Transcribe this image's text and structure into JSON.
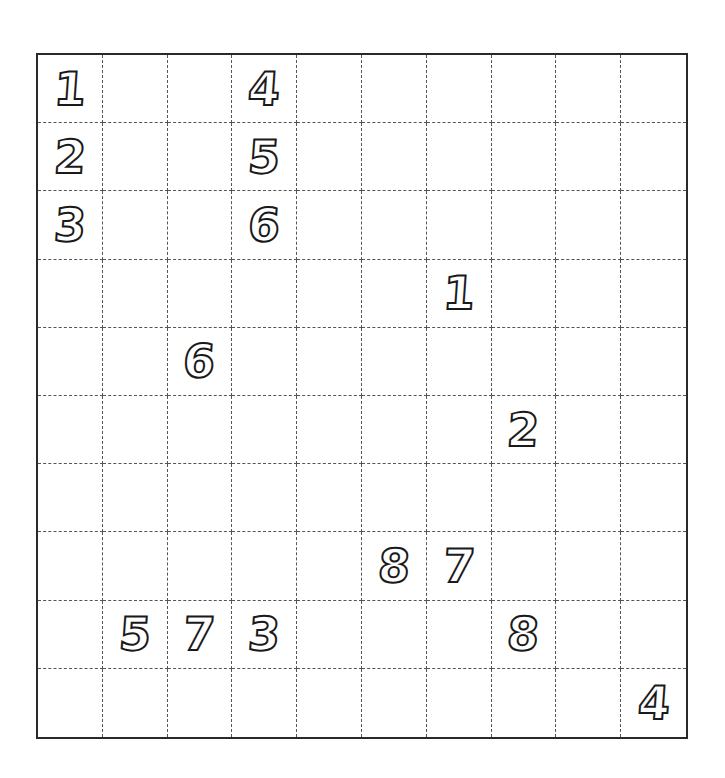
{
  "puzzle": {
    "rows": 10,
    "cols": 10,
    "colors": {
      "border": "#2a2a2a",
      "grid_lines": "#555555",
      "digit_outline": "#1a1a1a",
      "background": "#ffffff"
    },
    "cells": [
      {
        "row": 0,
        "col": 0,
        "value": "1"
      },
      {
        "row": 0,
        "col": 3,
        "value": "4"
      },
      {
        "row": 1,
        "col": 0,
        "value": "2"
      },
      {
        "row": 1,
        "col": 3,
        "value": "5"
      },
      {
        "row": 2,
        "col": 0,
        "value": "3"
      },
      {
        "row": 2,
        "col": 3,
        "value": "6"
      },
      {
        "row": 3,
        "col": 6,
        "value": "1"
      },
      {
        "row": 4,
        "col": 2,
        "value": "6"
      },
      {
        "row": 5,
        "col": 7,
        "value": "2"
      },
      {
        "row": 7,
        "col": 5,
        "value": "8"
      },
      {
        "row": 7,
        "col": 6,
        "value": "7"
      },
      {
        "row": 8,
        "col": 1,
        "value": "5"
      },
      {
        "row": 8,
        "col": 2,
        "value": "7"
      },
      {
        "row": 8,
        "col": 3,
        "value": "3"
      },
      {
        "row": 8,
        "col": 7,
        "value": "8"
      },
      {
        "row": 9,
        "col": 9,
        "value": "4"
      }
    ]
  }
}
